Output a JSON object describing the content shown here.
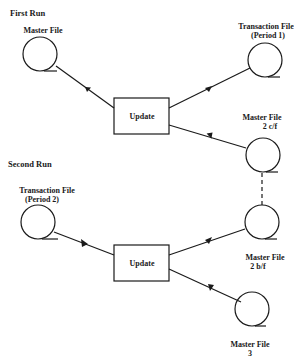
{
  "diagram": {
    "sections": {
      "first_run": "First Run",
      "second_run": "Second Run"
    },
    "first_run": {
      "master_file": {
        "label": "Master File"
      },
      "transaction_file": {
        "line1": "Transaction File",
        "line2": "(Period 1)"
      },
      "update": {
        "label": "Update"
      },
      "output_master": {
        "line1": "Master File",
        "line2": "2 c/f"
      }
    },
    "second_run": {
      "transaction_file": {
        "line1": "Transaction File",
        "line2": "(Period 2)"
      },
      "input_master": {
        "line1": "Master File",
        "line2": "2 b/f"
      },
      "update": {
        "label": "Update"
      },
      "output_master": {
        "line1": "Master File",
        "line2": "3"
      }
    },
    "colors": {
      "ink": "#1a1a1a",
      "background": "#ffffff"
    }
  }
}
